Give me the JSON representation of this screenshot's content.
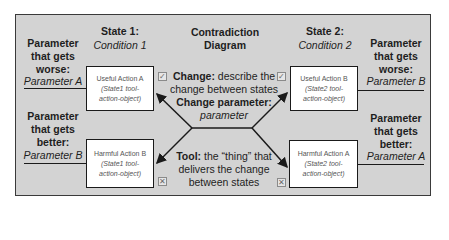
{
  "title": "Contradiction Diagram",
  "state1": {
    "label": "State 1:",
    "condition": "Condition 1"
  },
  "state2": {
    "label": "State 2:",
    "condition": "Condition 2"
  },
  "left": {
    "worse": {
      "line1": "Parameter",
      "line2": "that gets",
      "line3": "worse:",
      "param": "Parameter A"
    },
    "better": {
      "line1": "Parameter",
      "line2": "that gets",
      "line3": "better:",
      "param": "Parameter B"
    }
  },
  "right": {
    "worse": {
      "line1": "Parameter",
      "line2": "that gets",
      "line3": "worse:",
      "param": "Parameter B"
    },
    "better": {
      "line1": "Parameter",
      "line2": "that gets",
      "line3": "better:",
      "param": "Parameter A"
    }
  },
  "boxes": {
    "top_left": {
      "title": "Useful Action A",
      "sub1": "(State1 tool-",
      "sub2": "action-object)"
    },
    "top_right": {
      "title": "Useful Action B",
      "sub1": "(State2 tool-",
      "sub2": "action-object)"
    },
    "bottom_left": {
      "title": "Harmful Action B",
      "sub1": "(State1 tool-",
      "sub2": "action-object)"
    },
    "bottom_right": {
      "title": "Harmful Action A",
      "sub1": "(State2 tool-",
      "sub2": "action-object)"
    }
  },
  "center": {
    "change_label": "Change:",
    "change_text1": "describe the",
    "change_text2": "change between states",
    "change_param_label": "Change parameter:",
    "change_param_value": "parameter",
    "tool_label": "Tool:",
    "tool_text1": "the “thing” that",
    "tool_text2": "delivers the change",
    "tool_text3": "between states"
  },
  "icons": {
    "check": "✓",
    "cross": "✕"
  },
  "colors": {
    "panel": "#d3d3d3",
    "border": "#3a3a3a",
    "box": "#ffffff",
    "text": "#1e1e1e"
  }
}
